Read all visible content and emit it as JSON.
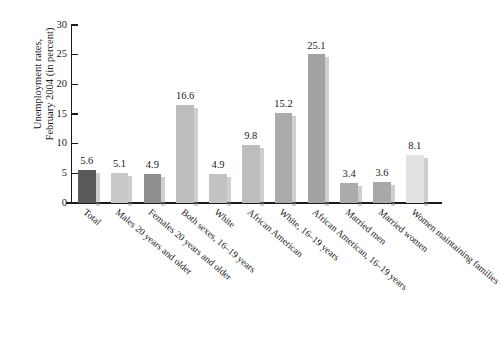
{
  "chart_data": {
    "type": "bar",
    "title": "",
    "xlabel": "",
    "ylabel": "Unemployment rates, February 2004 (in percent)",
    "ylabel_lines": [
      "Unemployment rates,",
      "February 2004 (in percent)"
    ],
    "ylim": [
      0,
      30
    ],
    "yticks": [
      0,
      5,
      10,
      15,
      20,
      25,
      30
    ],
    "ytick_labels": [
      "0",
      "5",
      "10",
      "15",
      "20",
      "25",
      "30"
    ],
    "grid": false,
    "legend": "none",
    "data_labels_shown": true,
    "categories": [
      "Total",
      "Males 20 years and older",
      "Females 20 years and older",
      "Both sexes, 16–19 years",
      "White",
      "African American",
      "White, 16–19 years",
      "African American, 16–19 years",
      "Married men",
      "Married women",
      "Women maintaining families"
    ],
    "values": [
      5.6,
      5.1,
      4.9,
      16.6,
      4.9,
      9.8,
      15.2,
      25.1,
      3.4,
      3.6,
      8.1
    ],
    "value_labels": [
      "5.6",
      "5.1",
      "4.9",
      "16.6",
      "4.9",
      "9.8",
      "15.2",
      "25.1",
      "3.4",
      "3.6",
      "8.1"
    ],
    "bar_colors": [
      "#595959",
      "#c8c8c8",
      "#8f8f8f",
      "#bdbdbd",
      "#c2c2c2",
      "#bdbdbd",
      "#aaaaaa",
      "#a2a2a2",
      "#ababab",
      "#a8a8a8",
      "#e2e2e2"
    ],
    "axis_color": "#1a1a1a"
  }
}
